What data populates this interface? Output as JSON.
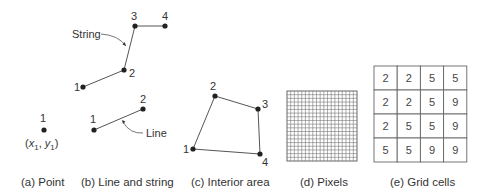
{
  "panels": {
    "point": {
      "caption": "(a) Point",
      "vertex_label": "1",
      "coord_label": "(x1, y1)",
      "coord_x": "x",
      "coord_y": "y",
      "coord_sub": "1"
    },
    "line_string": {
      "caption": "(b) Line and string",
      "string_label": "String",
      "line_label": "Line",
      "string_vertices": [
        "1",
        "2",
        "3",
        "4"
      ],
      "line_vertices": [
        "1",
        "2"
      ]
    },
    "interior_area": {
      "caption": "(c) Interior area",
      "vertices": [
        "1",
        "2",
        "3",
        "4"
      ]
    },
    "pixels": {
      "caption": "(d) Pixels",
      "grid_divisions": 19
    },
    "grid_cells": {
      "caption": "(e) Grid cells",
      "rows": [
        [
          "2",
          "2",
          "5",
          "5"
        ],
        [
          "2",
          "2",
          "5",
          "9"
        ],
        [
          "2",
          "5",
          "5",
          "9"
        ],
        [
          "5",
          "5",
          "9",
          "9"
        ]
      ]
    }
  },
  "colors": {
    "ink": "#333333",
    "line": "#555555",
    "grid": "#666666"
  }
}
